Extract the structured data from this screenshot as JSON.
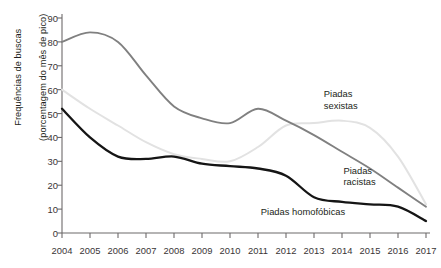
{
  "chart_data": {
    "type": "line",
    "title": "",
    "xlabel": "",
    "ylabel": "Frequências de buscas (porcentagem do mês de pico)",
    "ylabel_line1": "Frequências de buscas",
    "ylabel_line2": "(porcentagem do mês de pico)",
    "x": [
      2004,
      2005,
      2006,
      2007,
      2008,
      2009,
      2010,
      2011,
      2012,
      2013,
      2014,
      2015,
      2016,
      2017
    ],
    "xtick_labels": [
      "2004",
      "2005",
      "2006",
      "2007",
      "2008",
      "2009",
      "2010",
      "2011",
      "2012",
      "2013",
      "2014",
      "2015",
      "2016",
      "2017"
    ],
    "ytick_labels": [
      "0",
      "10",
      "20",
      "30",
      "40",
      "50",
      "60",
      "70",
      "80",
      "90"
    ],
    "yticks": [
      0,
      10,
      20,
      30,
      40,
      50,
      60,
      70,
      80,
      90
    ],
    "xlim": [
      2004,
      2017
    ],
    "ylim": [
      0,
      90
    ],
    "grid": false,
    "legend": "inline-labels",
    "series": [
      {
        "name": "Piadas racistas",
        "color": "#808080",
        "values": [
          80,
          84,
          80,
          66,
          53,
          48,
          46,
          52,
          47,
          41,
          34,
          27,
          19,
          11
        ],
        "label_x": 2014.05,
        "label_y": 26
      },
      {
        "name": "Piadas sexistas",
        "color": "#e2e2e2",
        "values": [
          60,
          52,
          45,
          38,
          33,
          31,
          30,
          36,
          45,
          46,
          47,
          44,
          32,
          12
        ],
        "label_x": 2013.35,
        "label_y": 58
      },
      {
        "name": "Piadas homofóbicas",
        "color": "#151515",
        "values": [
          52,
          40,
          32,
          31,
          32,
          29,
          28,
          27,
          24,
          15,
          13,
          12,
          11,
          5
        ],
        "label_x": 2011.1,
        "label_y": 9
      }
    ]
  }
}
